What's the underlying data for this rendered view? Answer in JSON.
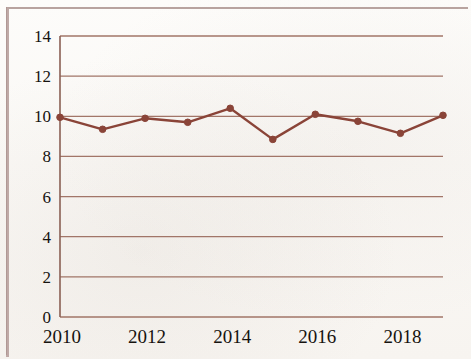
{
  "chart_data": {
    "type": "line",
    "title": "",
    "subtitle": "",
    "xlabel": "",
    "ylabel": "",
    "x": [
      2010,
      2011,
      2012,
      2013,
      2014,
      2015,
      2016,
      2017,
      2018,
      2019
    ],
    "values": [
      9.95,
      9.35,
      9.9,
      9.7,
      10.4,
      8.85,
      10.1,
      9.75,
      9.15,
      10.05
    ],
    "series": [
      {
        "name": "series-1",
        "values": [
          9.95,
          9.35,
          9.9,
          9.7,
          10.4,
          8.85,
          10.1,
          9.75,
          9.15,
          10.05
        ]
      }
    ],
    "ylim": [
      0,
      14
    ],
    "xlim": [
      2010,
      2019
    ],
    "ytick_labels": [
      "0",
      "2",
      "4",
      "6",
      "8",
      "10",
      "12",
      "14"
    ],
    "ytick_values": [
      0,
      2,
      4,
      6,
      8,
      10,
      12,
      14
    ],
    "xtick_labels": [
      "2010",
      "2012",
      "2014",
      "2016",
      "2018"
    ],
    "xtick_values": [
      2010,
      2012,
      2014,
      2016,
      2018
    ],
    "grid": "horizontal",
    "legend": "none",
    "line_color": "#8a4438",
    "marker_color": "#8a4438",
    "marker": "circle",
    "grid_color": "#9a6a5c",
    "axis_color": "#8a6054"
  },
  "axis": {
    "y_ticks": [
      {
        "label": "14",
        "value": 14
      },
      {
        "label": "12",
        "value": 12
      },
      {
        "label": "10",
        "value": 10
      },
      {
        "label": "8",
        "value": 8
      },
      {
        "label": "6",
        "value": 6
      },
      {
        "label": "4",
        "value": 4
      },
      {
        "label": "2",
        "value": 2
      },
      {
        "label": "0",
        "value": 0
      }
    ],
    "x_ticks": [
      {
        "label": "2010",
        "value": 2010
      },
      {
        "label": "2012",
        "value": 2012
      },
      {
        "label": "2014",
        "value": 2014
      },
      {
        "label": "2016",
        "value": 2016
      },
      {
        "label": "2018",
        "value": 2018
      }
    ]
  }
}
